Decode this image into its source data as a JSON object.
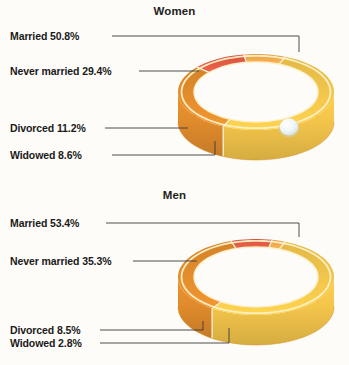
{
  "background_color": "#fdfcf8",
  "chart_data": {
    "type": "pie",
    "note": "Two 3-D ring (band) charts drawn as wedding rings; each ring is a full pie split into four segments.",
    "legend_position": "left-callout-labels",
    "colors": {
      "married": "#f2c44a",
      "never_married": "#e08b2c",
      "divorced": "#e05a44",
      "widowed": "#f0a94e",
      "ring_highlight": "#fdf0c8",
      "ring_shadow": "#d98e23",
      "leader_line": "#3a3a3a",
      "text": "#1a1a1a",
      "jewel": "#eef4f5"
    },
    "charts": [
      {
        "id": "women",
        "title": "Women",
        "categories": [
          "Married",
          "Never married",
          "Divorced",
          "Widowed"
        ],
        "values": [
          50.8,
          29.4,
          11.2,
          8.6
        ],
        "labels": [
          "Married 50.8%",
          "Never married 29.4%",
          "Divorced 11.2%",
          "Widowed 8.6%"
        ],
        "has_jewel": true
      },
      {
        "id": "men",
        "title": "Men",
        "categories": [
          "Married",
          "Never married",
          "Divorced",
          "Widowed"
        ],
        "values": [
          53.4,
          35.3,
          8.5,
          2.8
        ],
        "labels": [
          "Married 53.4%",
          "Never married 35.3%",
          "Divorced 8.5%",
          "Widowed 2.8%"
        ],
        "has_jewel": false
      }
    ]
  },
  "women": {
    "title": "Women",
    "label_married": "Married 50.8%",
    "label_never_married": "Never married 29.4%",
    "label_divorced": "Divorced 11.2%",
    "label_widowed": "Widowed 8.6%"
  },
  "men": {
    "title": "Men",
    "label_married": "Married 53.4%",
    "label_never_married": "Never married 35.3%",
    "label_divorced": "Divorced 8.5%",
    "label_widowed": "Widowed 2.8%"
  }
}
